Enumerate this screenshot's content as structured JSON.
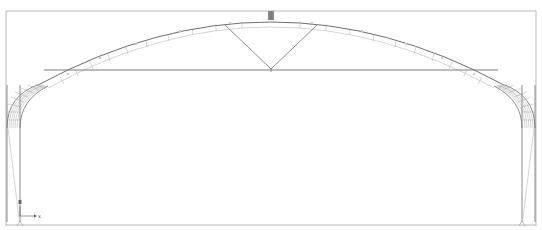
{
  "viewport": {
    "frame_color": "#b8b8b8",
    "structure_color": "#6e6e6e",
    "mesh_color": "#9a9a9a",
    "background": "#ffffff"
  },
  "model": {
    "type": "arched-roof-truss",
    "members": [
      "left-column",
      "right-column",
      "left-haunch",
      "right-haunch",
      "top-chord-arch",
      "bottom-tie",
      "left-diagonal",
      "right-diagonal",
      "ridge-node",
      "center-hanger"
    ],
    "supports": [
      "left-base-support",
      "right-base-support"
    ]
  },
  "triad": {
    "x_label": "x",
    "z_label": "z"
  }
}
